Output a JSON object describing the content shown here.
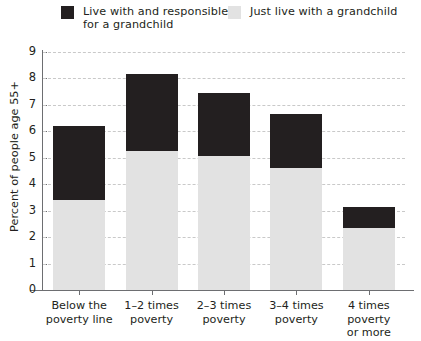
{
  "chart_data": {
    "type": "bar",
    "subtype": "stacked",
    "title": "",
    "xlabel": "",
    "ylabel": "Percent of people age 55+",
    "ylim": [
      0,
      9
    ],
    "yticks": [
      0,
      1,
      2,
      3,
      4,
      5,
      6,
      7,
      8,
      9
    ],
    "ytick_labels": [
      "0",
      "1",
      "2",
      "3",
      "4",
      "5",
      "6",
      "7",
      "8",
      "9"
    ],
    "grid": "horizontal-dashed",
    "legend_position": "top",
    "categories": [
      "Below the\npoverty line",
      "1–2 times\npoverty",
      "2–3 times\npoverty",
      "3–4 times\npoverty",
      "4 times poverty\nor more"
    ],
    "series": [
      {
        "name": "Just live with a grandchild",
        "color": "#e2e2e2",
        "values": [
          3.4,
          5.25,
          5.05,
          4.6,
          2.35
        ]
      },
      {
        "name": "Live with and responsible for a grandchild",
        "color": "#231f20",
        "values": [
          2.8,
          2.9,
          2.4,
          2.05,
          0.8
        ]
      }
    ],
    "totals": [
      6.2,
      8.15,
      7.45,
      6.65,
      3.15
    ]
  },
  "legend": {
    "items": [
      {
        "label": "Live with and responsible\nfor a grandchild",
        "color": "#231f20",
        "swatch_name": "legend-swatch-dark"
      },
      {
        "label": "Just live with a grandchild",
        "color": "#e2e2e2",
        "swatch_name": "legend-swatch-light"
      }
    ]
  },
  "axes": {
    "y_title": "Percent of people age 55+",
    "y_tick_labels": [
      "9",
      "8",
      "7",
      "6",
      "5",
      "4",
      "3",
      "2",
      "1",
      "0"
    ],
    "x_tick_labels": [
      "Below the\npoverty line",
      "1–2 times\npoverty",
      "2–3 times\npoverty",
      "3–4 times\npoverty",
      "4 times poverty\nor more"
    ]
  },
  "colors": {
    "dark": "#231f20",
    "light": "#e2e2e2",
    "grid": "#c9c9c9",
    "axis": "#6d6e71",
    "background": "#ffffff"
  }
}
